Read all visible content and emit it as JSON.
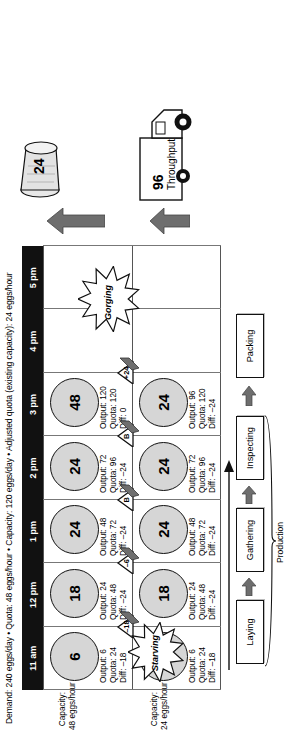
{
  "title": "Demand: 240 eggs/day • Quota: 48 eggs/hour • Capacity: 120 eggs/day • Adjusted quota (existing capacity): 24 eggs/hour",
  "timeline": {
    "labels": [
      "11 am",
      "12 pm",
      "1 pm",
      "2 pm",
      "3 pm",
      "4 pm",
      "5 pm"
    ]
  },
  "rows": [
    {
      "id": "row-top",
      "capacity_label_line1": "Capacity:",
      "capacity_label_line2": "48 eggs/hour",
      "cells": [
        {
          "value": "6",
          "output": "Output: 6",
          "quota": "Quota: 24",
          "diff": "Diff: –18"
        },
        {
          "value": "18",
          "output": "Output: 24",
          "quota": "Quota: 48",
          "diff": "Diff: –24"
        },
        {
          "value": "24",
          "output": "Output: 48",
          "quota": "Quota: 72",
          "diff": "Diff: –24"
        },
        {
          "value": "24",
          "output": "Output: 72",
          "quota": "Quota: 96",
          "diff": "Diff: –24"
        },
        {
          "value": "48",
          "output": "Output: 120",
          "quota": "Quota: 120",
          "diff": "Diff: 0"
        }
      ]
    },
    {
      "id": "row-bottom",
      "capacity_label_line1": "Capacity:",
      "capacity_label_line2": "24 eggs/hour",
      "cells": [
        {
          "value": "6",
          "output": "Output: 6",
          "quota": "Quota: 24",
          "diff": "Diff: –18"
        },
        {
          "value": "18",
          "output": "Output: 24",
          "quota": "Quota: 48",
          "diff": "Diff: –24"
        },
        {
          "value": "24",
          "output": "Output: 48",
          "quota": "Quota: 72",
          "diff": "Diff: –24"
        },
        {
          "value": "24",
          "output": "Output: 72",
          "quota": "Quota: 96",
          "diff": "Diff: –24"
        },
        {
          "value": "24",
          "output": "Output: 96",
          "quota": "Quota: 120",
          "diff": "Diff: –24"
        }
      ]
    }
  ],
  "buffers": [
    {
      "label": "–18"
    },
    {
      "label": "–6"
    },
    {
      "label": "B"
    },
    {
      "label": "B"
    },
    {
      "label": "+24"
    }
  ],
  "bursts": [
    {
      "id": "starving",
      "label": "Starving"
    },
    {
      "id": "gorging",
      "label": "Gorging"
    }
  ],
  "waste": {
    "value": "24",
    "icon": "trash-can-icon"
  },
  "throughput": {
    "value": "96",
    "label": "Throughput",
    "icon": "truck-icon"
  },
  "process": {
    "group_label": "Production",
    "steps": [
      "Laying",
      "Gathering",
      "Inspecting"
    ],
    "final_step": "Packing"
  },
  "colors": {
    "timebar": "#111111",
    "circle_fill": "#d6d6d6",
    "arrow_fill": "#6e6e6e",
    "line": "#555555"
  }
}
